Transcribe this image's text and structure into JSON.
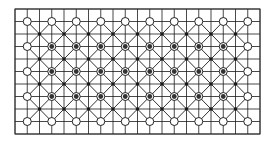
{
  "diagram": {
    "type": "grid-mesh",
    "columns": 10,
    "rows": 5,
    "border": {
      "x": 15,
      "y": 9,
      "width": 245,
      "height": 125
    },
    "cell_width": 24.5,
    "cell_height": 25,
    "node_origin": {
      "x": 27.25,
      "y": 21.5
    },
    "node_style": {
      "boundary": "open-circle",
      "interior": "circle-with-dark-center"
    },
    "center_dot_style": "small-dark-dot",
    "colors": {
      "line": "#1a1a1a",
      "border": "#333333",
      "node_fill_interior": "#333333",
      "background": "#ffffff"
    }
  }
}
